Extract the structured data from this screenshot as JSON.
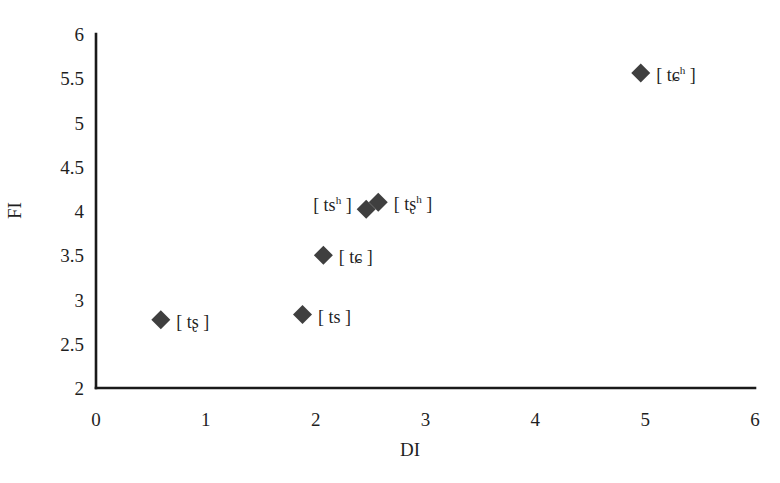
{
  "chart_data": {
    "type": "scatter",
    "title": "",
    "xlabel": "DI",
    "ylabel": "FI",
    "xlim": [
      0,
      6
    ],
    "ylim": [
      2,
      6
    ],
    "xticks": [
      "0",
      "1",
      "2",
      "3",
      "4",
      "5",
      "6"
    ],
    "yticks": [
      "2",
      "2.5",
      "3",
      "3.5",
      "4",
      "4.5",
      "5",
      "5.5",
      "6"
    ],
    "xtick_values": [
      0,
      1,
      2,
      3,
      4,
      5,
      6
    ],
    "ytick_values": [
      2,
      2.5,
      3,
      3.5,
      4,
      4.5,
      5,
      5.5,
      6
    ],
    "grid": false,
    "legend": "none",
    "marker_shape": "diamond",
    "marker_color": "#3f3f3f",
    "axis_color": "#1a1a1a",
    "points": [
      {
        "id": "ts-retroflex",
        "label_text": "[ tʂ ]",
        "label_base": "[ tʂ ]",
        "label_sup": "",
        "x": 0.59,
        "y": 2.77,
        "label_side": "right"
      },
      {
        "id": "ts",
        "label_text": "[ ts ]",
        "label_base": "[ ts ]",
        "label_sup": "",
        "x": 1.88,
        "y": 2.83,
        "label_side": "right"
      },
      {
        "id": "t-alveolopalatal",
        "label_text": "[ tɕ ]",
        "label_base": "[ tɕ ]",
        "label_sup": "",
        "x": 2.07,
        "y": 3.5,
        "label_side": "right"
      },
      {
        "id": "ts-aspirated",
        "label_text": "[ tsʰ ]",
        "label_base": "[ ts",
        "label_sup": "h",
        "label_tail": " ]",
        "x": 2.46,
        "y": 4.02,
        "label_side": "left"
      },
      {
        "id": "ts-retroflex-aspirated",
        "label_text": "[ tʂʰ ]",
        "label_base": "[ tʂ",
        "label_sup": "h",
        "label_tail": " ]",
        "x": 2.57,
        "y": 4.1,
        "label_side": "right"
      },
      {
        "id": "t-alveolopalatal-aspirated",
        "label_text": "[ tɕʰ ]",
        "label_base": "[ tɕ",
        "label_sup": "h",
        "label_tail": " ]",
        "x": 4.96,
        "y": 5.56,
        "label_side": "right"
      }
    ]
  }
}
